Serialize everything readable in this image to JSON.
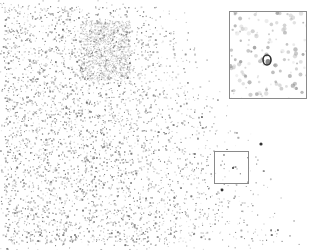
{
  "image": {
    "width": 317,
    "height": 250,
    "background": "#ffffff",
    "speckle_color": "#8c8c8c",
    "description": "Grayscale speckle micrograph with dense particle field on left fading to sparse on right"
  },
  "roi_box": {
    "x": 214,
    "y": 151,
    "w": 35,
    "h": 33,
    "stroke": "#8a8a8a"
  },
  "inset": {
    "x": 229,
    "y": 11,
    "w": 78,
    "h": 88,
    "stroke": "#8a8a8a",
    "feature": {
      "cx": 37,
      "cy": 48,
      "rx": 4,
      "ry": 5,
      "color": "#2a2a2a"
    }
  },
  "dark_spots": [
    {
      "x": 261,
      "y": 144,
      "r": 1.6
    },
    {
      "x": 222,
      "y": 190,
      "r": 1.4
    },
    {
      "x": 233,
      "y": 168,
      "r": 1.0
    }
  ]
}
